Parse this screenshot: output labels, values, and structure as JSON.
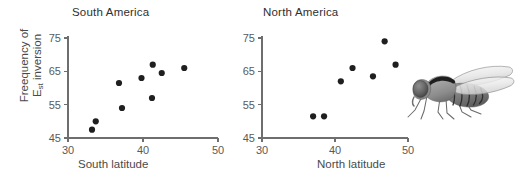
{
  "figure": {
    "background": "#ffffff",
    "point_color": "#1f1f1f",
    "axis_color": "#6e6e6e",
    "text_color": "#4a4a4a"
  },
  "panels": {
    "south": {
      "title": "South America",
      "xlabel": "South latitude",
      "ylabel_line1": "Freequency of",
      "ylabel_line2_main": "E",
      "ylabel_line2_sub": "st",
      "ylabel_line2_rest": " inversion",
      "xticks": [
        "30",
        "40",
        "50"
      ],
      "yticks": [
        "75",
        "65",
        "55",
        "45"
      ]
    },
    "north": {
      "title": "North America",
      "xlabel": "North latitude",
      "xticks": [
        "30",
        "40",
        "50"
      ],
      "yticks": [
        "75",
        "65",
        "55",
        "45"
      ]
    }
  },
  "illustration": {
    "name": "drosophila-fly",
    "description": "grayscale side view of a fruit fly"
  },
  "chart_data": [
    {
      "type": "scatter",
      "panel": "south",
      "title": "South America",
      "xlabel": "South latitude",
      "ylabel": "Freequency of Est inversion",
      "xlim": [
        30,
        50
      ],
      "ylim": [
        45,
        75
      ],
      "xticks": [
        30,
        40,
        50
      ],
      "yticks": [
        45,
        55,
        65,
        75
      ],
      "grid": false,
      "legend": null,
      "points": [
        {
          "x": 33.2,
          "y": 47.5
        },
        {
          "x": 33.7,
          "y": 50.0
        },
        {
          "x": 36.8,
          "y": 61.5
        },
        {
          "x": 37.2,
          "y": 54.0
        },
        {
          "x": 39.8,
          "y": 63.0
        },
        {
          "x": 41.2,
          "y": 57.0
        },
        {
          "x": 41.3,
          "y": 67.0
        },
        {
          "x": 42.5,
          "y": 64.5
        },
        {
          "x": 45.5,
          "y": 66.0
        }
      ]
    },
    {
      "type": "scatter",
      "panel": "north",
      "title": "North America",
      "xlabel": "North latitude",
      "ylabel": "Freequency of Est inversion",
      "xlim": [
        30,
        50
      ],
      "ylim": [
        45,
        75
      ],
      "xticks": [
        30,
        40,
        50
      ],
      "yticks": [
        45,
        55,
        65,
        75
      ],
      "grid": false,
      "legend": null,
      "points": [
        {
          "x": 37.0,
          "y": 51.5
        },
        {
          "x": 38.5,
          "y": 51.5
        },
        {
          "x": 40.8,
          "y": 62.0
        },
        {
          "x": 42.4,
          "y": 66.0
        },
        {
          "x": 45.2,
          "y": 63.5
        },
        {
          "x": 46.8,
          "y": 74.0
        },
        {
          "x": 48.3,
          "y": 67.0
        }
      ]
    }
  ]
}
